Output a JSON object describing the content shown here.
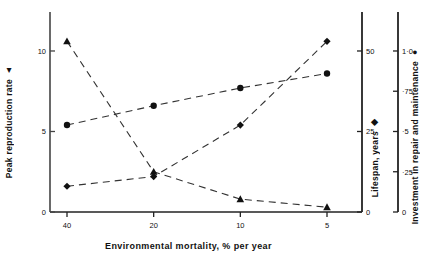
{
  "chart_data": {
    "type": "line",
    "title": "",
    "xlabel": "Environmental mortality, % per year",
    "x_tick_labels": [
      "40",
      "20",
      "10",
      "5"
    ],
    "x": [
      40,
      20,
      10,
      5
    ],
    "x_scale": "reversed",
    "grid": false,
    "legend": "inline-axis-markers",
    "axes": [
      {
        "id": "left",
        "label": "Peak reproduction rate",
        "marker": "triangle",
        "marker_glyph": "▲",
        "position": "left",
        "ylim": [
          0,
          11.8
        ],
        "ticks": [
          0,
          5,
          10
        ],
        "tick_labels": [
          "0",
          "5",
          "10"
        ]
      },
      {
        "id": "right1",
        "label": "Lifespan, years",
        "marker": "diamond",
        "marker_glyph": "◆",
        "position": "right",
        "ylim": [
          0,
          59
        ],
        "ticks": [
          0,
          25,
          50
        ],
        "tick_labels": [
          "0",
          "25",
          "50"
        ]
      },
      {
        "id": "right2",
        "label": "Investment in repair and maintenance",
        "marker": "circle",
        "marker_glyph": "●",
        "position": "far-right",
        "ylim": [
          0,
          1.18
        ],
        "ticks": [
          0,
          0.25,
          0.5,
          0.75,
          1.0
        ],
        "tick_labels": [
          "0",
          "·25",
          "·5",
          "·75",
          "1·0"
        ]
      }
    ],
    "series": [
      {
        "name": "Peak reproduction rate",
        "axis": "left",
        "marker": "triangle",
        "linestyle": "dashed",
        "values": [
          10.6,
          2.5,
          0.8,
          0.3
        ]
      },
      {
        "name": "Lifespan, years",
        "axis": "right1",
        "marker": "diamond",
        "linestyle": "dashed",
        "values": [
          8,
          11,
          27,
          53
        ]
      },
      {
        "name": "Investment in repair and maintenance",
        "axis": "right2",
        "marker": "circle",
        "linestyle": "dashed",
        "values": [
          0.54,
          0.66,
          0.77,
          0.86
        ]
      }
    ]
  }
}
